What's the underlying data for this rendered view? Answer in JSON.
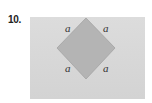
{
  "problem": {
    "number": "10."
  },
  "figure": {
    "shape": "square rotated 45 degrees (diamond) inscribed in rectangle",
    "background_color": "#d8d8d8",
    "diamond_fill": "#b4b4b4",
    "diamond_stroke": "#a0a0a0",
    "side_labels": [
      {
        "position": "top-left",
        "text": "a"
      },
      {
        "position": "top-right",
        "text": "a"
      },
      {
        "position": "bottom-left",
        "text": "a"
      },
      {
        "position": "bottom-right",
        "text": "a"
      }
    ]
  }
}
